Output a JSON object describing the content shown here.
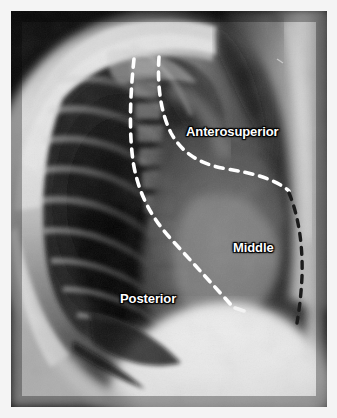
{
  "figure": {
    "name": "lateral-chest-radiograph-mediastinal-compartments",
    "modality": "Chest radiograph, lateral view",
    "width": 337,
    "height": 418,
    "border_color": "#f4f4f4",
    "plate_background": "#050505"
  },
  "annotations": {
    "labels": [
      {
        "id": "anterosuperior",
        "text": "Anterosuperior",
        "x": 175,
        "y": 113,
        "color": "#ffffff"
      },
      {
        "id": "middle",
        "text": "Middle",
        "x": 222,
        "y": 229,
        "color": "#ffffff"
      },
      {
        "id": "posterior",
        "text": "Posterior",
        "x": 109,
        "y": 280,
        "color": "#ffffff"
      }
    ],
    "boundary_lines": [
      {
        "id": "posterior-boundary",
        "style": "white-dashed",
        "color": "#ffffff",
        "description": "Anterior margin of the posterior compartment, running from the upper thoracic spine inferiorly and anteriorly to the diaphragm"
      },
      {
        "id": "anterosuperior-middle-boundary",
        "style": "white-dashed",
        "color": "#ffffff",
        "description": "Line descending from the thoracic inlet then sloping posteroinferiorly to separate anterosuperior from middle compartment"
      },
      {
        "id": "anterior-chest-wall-boundary",
        "style": "dark-dashed",
        "color": "#1b1b1b",
        "description": "Anterior limit of the middle compartment along the retrosternal soft tissues"
      }
    ]
  },
  "anatomy": {
    "structures": [
      "posterior ribs",
      "thoracic vertebral bodies",
      "scapula",
      "humerus and soft tissue of the raised arm",
      "retrosternal clear space",
      "cardiac silhouette",
      "hemidiaphragm",
      "posterior costophrenic sulcus"
    ]
  }
}
